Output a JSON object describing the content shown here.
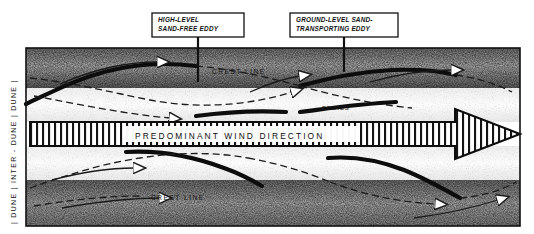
{
  "figure": {
    "type": "cross-section-diagram",
    "background_color": "#ffffff",
    "ink_color": "#111111",
    "sand_tone_color": "#8d8d8d"
  },
  "callouts": [
    {
      "id": "high-level-eddy",
      "line1": "HIGH-LEVEL",
      "line2": "SAND-FREE EDDY",
      "box": {
        "x": 152,
        "y": 13,
        "w": 92,
        "h": 24
      },
      "leader": {
        "x": 198,
        "y_from": 37,
        "y_to": 82
      }
    },
    {
      "id": "ground-level-eddy",
      "line1": "GROUND-LEVEL SAND-",
      "line2": "TRANSPORTING EDDY",
      "box": {
        "x": 290,
        "y": 13,
        "w": 108,
        "h": 24
      },
      "leader": {
        "x": 344,
        "y_from": 37,
        "y_to": 72
      }
    }
  ],
  "band_labels": {
    "crest_line_top": "CREST LINE",
    "crest_line_bottom": "CREST LINE",
    "eddies": "EDDIES"
  },
  "wind_arrow": {
    "label": "PREDOMINANT   WIND   DIRECTION",
    "label_words": [
      "PREDOMINANT",
      "WIND",
      "DIRECTION"
    ],
    "direction": "left-to-right",
    "hatched": true,
    "shaft": {
      "x": 30,
      "y": 122,
      "w": 425,
      "h": 24
    },
    "head": {
      "tip_x": 520,
      "half_height": 25
    }
  },
  "side_axis": {
    "orientation": "vertical-bottom-to-top",
    "text": "| DUNE  |  INTER - DUNE  |  DUNE  |",
    "segments": [
      "DUNE",
      "INTER - DUNE",
      "DUNE"
    ]
  },
  "frame": {
    "x": 26,
    "y": 48,
    "w": 494,
    "h": 178
  },
  "strata": [
    {
      "id": "dune-top",
      "y": 48,
      "h": 40,
      "tone": "gradient-dark-top"
    },
    {
      "id": "inter-dune-upper",
      "y": 88,
      "h": 34,
      "tone": "light"
    },
    {
      "id": "wind-band",
      "y": 122,
      "h": 24,
      "tone": "hatched"
    },
    {
      "id": "inter-dune-lower",
      "y": 146,
      "h": 34,
      "tone": "light"
    },
    {
      "id": "dune-bottom",
      "y": 180,
      "h": 46,
      "tone": "gradient-dark-bottom"
    }
  ]
}
